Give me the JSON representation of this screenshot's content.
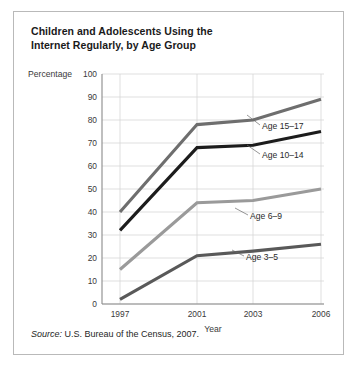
{
  "figure": {
    "title": "Children and Adolescents Using the Internet Regularly, by Age Group",
    "title_line1": "Children and Adolescents Using the",
    "title_line2": "Internet Regularly, by Age Group",
    "source_label": "Source:",
    "source_text": " U.S. Bureau of the Census, 2007."
  },
  "chart_data": {
    "type": "line",
    "title": "Children and Adolescents Using the Internet Regularly, by Age Group",
    "xlabel": "Year",
    "ylabel": "Percentage",
    "x": [
      1997,
      2001,
      2003,
      2006
    ],
    "categories": [
      "1997",
      "2001",
      "2003",
      "2006"
    ],
    "xticklabels": [
      "1997",
      "2001",
      "2003",
      "2006"
    ],
    "yticklabels": [
      "0",
      "10",
      "20",
      "30",
      "40",
      "50",
      "60",
      "70",
      "80",
      "90",
      "100"
    ],
    "yticks": [
      0,
      10,
      20,
      30,
      40,
      50,
      60,
      70,
      80,
      90,
      100
    ],
    "ylim": [
      0,
      100
    ],
    "grid": true,
    "legend": "inline-labels",
    "series": [
      {
        "name": "Age 15–17",
        "label": "Age 15–17",
        "color": "#6e6e6e",
        "values": [
          40,
          78,
          80,
          89
        ]
      },
      {
        "name": "Age 10–14",
        "label": "Age 10–14",
        "color": "#1c1c1c",
        "values": [
          32,
          68,
          69,
          75
        ]
      },
      {
        "name": "Age 6–9",
        "label": "Age 6–9",
        "color": "#9a9a9a",
        "values": [
          15,
          44,
          45,
          50
        ]
      },
      {
        "name": "Age 3–5",
        "label": "Age 3–5",
        "color": "#595959",
        "values": [
          2,
          21,
          23,
          26
        ]
      }
    ]
  }
}
